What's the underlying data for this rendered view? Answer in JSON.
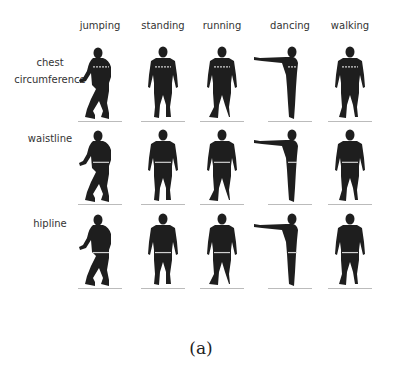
{
  "figure": {
    "columns": [
      {
        "label": "jumping",
        "x": 100,
        "pose": "squat"
      },
      {
        "label": "standing",
        "x": 163,
        "pose": "stand"
      },
      {
        "label": "running",
        "x": 222,
        "pose": "run"
      },
      {
        "label": "dancing",
        "x": 290,
        "pose": "dance"
      },
      {
        "label": "walking",
        "x": 350,
        "pose": "walk"
      }
    ],
    "rows": [
      {
        "label": "chest\ncircumference",
        "label_lines": [
          "chest",
          "circumference"
        ],
        "y": 45,
        "measure": "chest"
      },
      {
        "label": "waistline",
        "label_lines": [
          "waistline"
        ],
        "y": 128,
        "measure": "waist"
      },
      {
        "label": "hipline",
        "label_lines": [
          "hipline"
        ],
        "y": 212,
        "measure": "hip"
      }
    ],
    "caption": "(a)",
    "colors": {
      "silhouette": "#1e1e1e",
      "measure_line": "#d0d0d0",
      "label_text": "#333333"
    }
  }
}
